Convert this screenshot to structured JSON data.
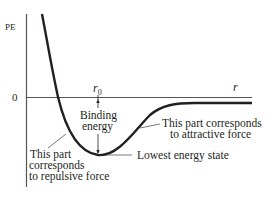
{
  "diagram": {
    "type": "potential-energy-curve",
    "axes": {
      "y_label": "PE",
      "x_label": "r",
      "origin_label": "0"
    },
    "markers": {
      "equilibrium_label": "r",
      "equilibrium_subscript": "0"
    },
    "annotations": {
      "binding_energy_line1": "Binding",
      "binding_energy_line2": "energy",
      "lowest_energy": "Lowest energy state",
      "attractive_line1": "This part corresponds",
      "attractive_line2": "to attractive force",
      "repulsive_line1": "This part",
      "repulsive_line2": "corresponds",
      "repulsive_line3": "to repulsive force"
    },
    "colors": {
      "curve": "#231f20",
      "axis": "#555555",
      "text": "#231f20"
    }
  }
}
